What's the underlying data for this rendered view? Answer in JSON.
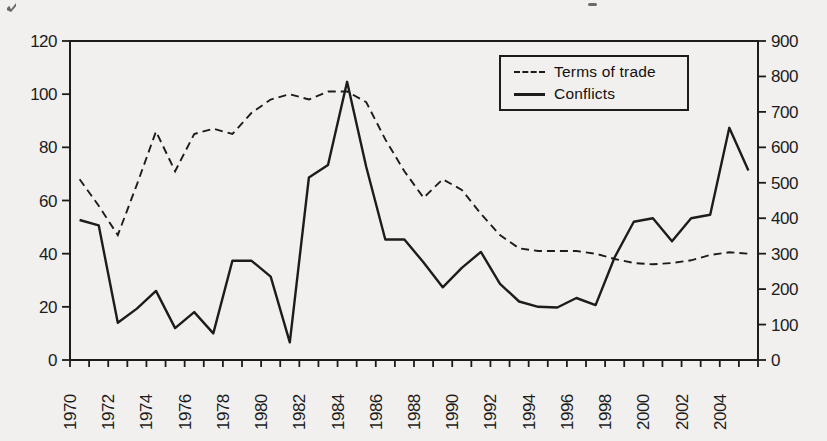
{
  "page": {
    "background_color": "#f1f0ee",
    "ink_color": "#1c1c1c"
  },
  "legend": {
    "terms_of_trade_label": "Terms of trade",
    "conflicts_label": "Conflicts"
  },
  "chart_data": {
    "type": "line",
    "title": "",
    "xlabel": "",
    "ylabel_left": "",
    "ylabel_right": "",
    "x": [
      1970,
      1971,
      1972,
      1973,
      1974,
      1975,
      1976,
      1977,
      1978,
      1979,
      1980,
      1981,
      1982,
      1983,
      1984,
      1985,
      1986,
      1987,
      1988,
      1989,
      1990,
      1991,
      1992,
      1993,
      1994,
      1995,
      1996,
      1997,
      1998,
      1999,
      2000,
      2001,
      2002,
      2003,
      2004,
      2005
    ],
    "x_tick_labels": [
      1970,
      1972,
      1974,
      1976,
      1978,
      1980,
      1982,
      1984,
      1986,
      1988,
      1990,
      1992,
      1994,
      1996,
      1998,
      2000,
      2002,
      2004
    ],
    "left_axis": {
      "min": 0,
      "max": 120,
      "ticks": [
        0,
        20,
        40,
        60,
        80,
        100,
        120
      ]
    },
    "right_axis": {
      "min": 0,
      "max": 900,
      "ticks": [
        0,
        100,
        200,
        300,
        400,
        500,
        600,
        700,
        800,
        900
      ]
    },
    "legend_position": "top-right-inside",
    "grid": false,
    "series": [
      {
        "name": "Terms of trade",
        "axis": "left",
        "style": "dashed",
        "values": [
          68,
          58,
          47,
          66,
          86,
          71,
          85,
          87,
          85,
          93,
          98,
          100,
          98,
          101,
          101,
          97,
          83,
          71,
          61,
          68,
          64,
          55,
          47,
          42,
          41,
          41,
          41,
          40,
          38,
          36.5,
          36,
          36.5,
          37.5,
          39.5,
          40.5,
          40
        ]
      },
      {
        "name": "Conflicts",
        "axis": "right",
        "style": "solid",
        "values": [
          395,
          380,
          105,
          145,
          195,
          90,
          135,
          75,
          280,
          280,
          235,
          50,
          515,
          550,
          785,
          545,
          340,
          340,
          275,
          205,
          260,
          305,
          215,
          165,
          150,
          148,
          175,
          155,
          290,
          390,
          400,
          335,
          400,
          410,
          655,
          535
        ]
      }
    ]
  }
}
